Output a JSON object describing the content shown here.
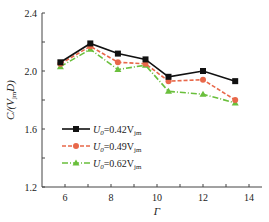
{
  "chart_data": {
    "type": "line",
    "title": "",
    "xlabel": "Γ",
    "ylabel": "C/(V_jm D)",
    "xlim": [
      5,
      14.5
    ],
    "ylim": [
      1.2,
      2.4
    ],
    "xticks": [
      6,
      8,
      10,
      12,
      14
    ],
    "yticks": [
      1.2,
      1.6,
      2.0,
      2.4
    ],
    "grid": false,
    "legend_position": "lower-left inside",
    "x": [
      5.8,
      7.1,
      8.3,
      9.5,
      10.5,
      12.0,
      13.4
    ],
    "series": [
      {
        "name": "U0=0.42Vjm",
        "label_main": "U",
        "label_sub0": "0",
        "label_eq": "=0.42V",
        "label_sub1": "jm",
        "color": "#111111",
        "marker": "square",
        "dash": "solid",
        "values": [
          2.06,
          2.19,
          2.12,
          2.08,
          1.96,
          2.0,
          1.93
        ]
      },
      {
        "name": "U0=0.49Vjm",
        "label_main": "U",
        "label_sub0": "0",
        "label_eq": "=0.49V",
        "label_sub1": "jm",
        "color": "#e8684a",
        "marker": "circle",
        "dash": "dashed",
        "values": [
          2.05,
          2.17,
          2.06,
          2.05,
          1.93,
          1.94,
          1.8
        ]
      },
      {
        "name": "U0=0.62Vjm",
        "label_main": "U",
        "label_sub0": "0",
        "label_eq": "=0.62V",
        "label_sub1": "jm",
        "color": "#6abf3c",
        "marker": "triangle",
        "dash": "dashdot",
        "values": [
          2.03,
          2.15,
          2.01,
          2.04,
          1.86,
          1.84,
          1.78
        ]
      }
    ]
  },
  "axis": {
    "y_tick_labels": [
      "2.4",
      "2.0",
      "1.6",
      "1.2"
    ],
    "x_tick_labels": [
      "6",
      "8",
      "10",
      "12",
      "14"
    ],
    "x_title": "Γ",
    "y_title_main": "C/(V",
    "y_title_sub": "jm",
    "y_title_end": "D)"
  }
}
